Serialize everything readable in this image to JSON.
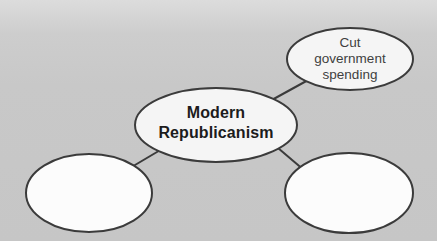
{
  "canvas": {
    "width": 437,
    "height": 241
  },
  "colors": {
    "background": "#c7c7c7",
    "background_top": "#dcdcdc",
    "node_fill": "#f5f5f5",
    "blank_node_fill": "#fcfcfc",
    "stroke": "#3b3b3b",
    "center_text": "#1c1c1c",
    "secondary_text": "#3f3f3f"
  },
  "diagram": {
    "type": "concept-map",
    "center_node": {
      "label": "Modern Republicanism",
      "emphasis": "bold"
    },
    "nodes": [
      {
        "position": "top-right",
        "label": "Cut government spending"
      },
      {
        "position": "bottom-left",
        "label": ""
      },
      {
        "position": "bottom-right",
        "label": ""
      }
    ],
    "edges": [
      {
        "from": "Modern Republicanism",
        "to": "Cut government spending"
      },
      {
        "from": "Modern Republicanism",
        "to": "blank-bottom-left"
      },
      {
        "from": "Modern Republicanism",
        "to": "blank-bottom-right"
      }
    ]
  }
}
